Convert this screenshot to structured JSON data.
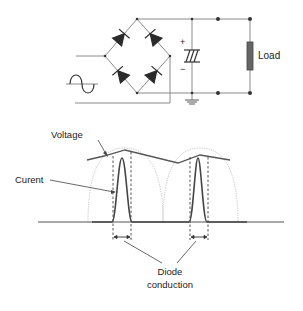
{
  "circuit": {
    "load_label": "Load",
    "cap_plus": "+",
    "cap_minus": "−",
    "source_symbol": "ac-sine-source-icon"
  },
  "waveform": {
    "voltage_label": "Voltage",
    "current_label": "Curent",
    "diode_label_line1": "Diode",
    "diode_label_line2": "conduction"
  },
  "colors": {
    "wire": "#8a8a8a",
    "diode": "#2b2b2b",
    "voltage_line": "#555555",
    "current_pulse": "#444444",
    "rectified_sine": "#bbbbbb",
    "load": "#666666"
  }
}
